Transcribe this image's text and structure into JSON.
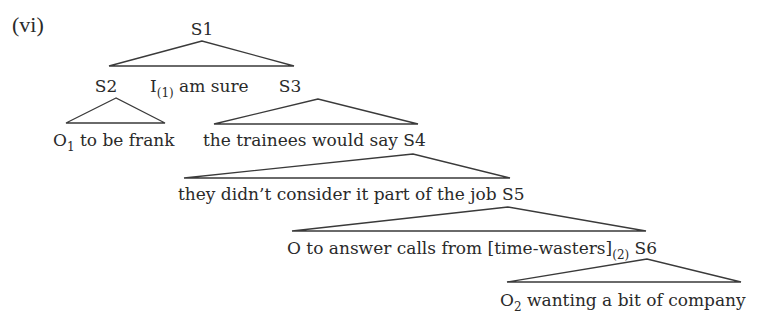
{
  "example_label": "(vi)",
  "nodes": {
    "s1": "S1",
    "s2": "S2",
    "s3": "S3"
  },
  "rows": {
    "r2_middle": {
      "pre": "I",
      "sub": "(1)",
      "post": " am sure"
    },
    "r3_left": {
      "pre": "O",
      "sub": "1",
      "post": " to be frank"
    },
    "r3_right": "the trainees would say S4",
    "r4": "they didn’t consider it part of the job S5",
    "r5": {
      "pre": "O to answer calls from [time-wasters]",
      "sub": "(2)",
      "post": " S6"
    },
    "r6": {
      "pre": "O",
      "sub": "2",
      "post": " wanting a bit of company"
    }
  },
  "colors": {
    "text": "#2a2a2a",
    "lines": "#3a3a3a",
    "background": "#ffffff"
  }
}
